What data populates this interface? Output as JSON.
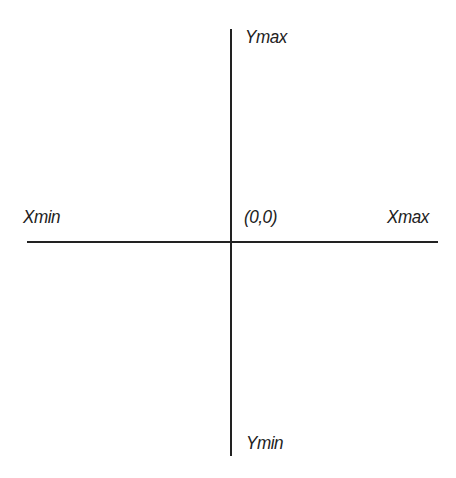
{
  "diagram": {
    "type": "coordinate-axes",
    "labels": {
      "y_max": "Ymax",
      "y_min": "Ymin",
      "x_min": "Xmin",
      "x_max": "Xmax",
      "origin": "(0,0)"
    },
    "colors": {
      "axis": "#222222",
      "text": "#222222",
      "background": "#ffffff"
    }
  }
}
